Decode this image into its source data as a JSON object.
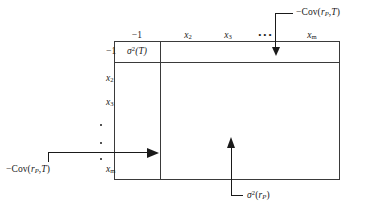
{
  "figure": {
    "colors": {
      "ink": "#1a1a1a",
      "rule": "#3a3a3a",
      "background": "#ffffff"
    }
  },
  "matrix": {
    "column_headers": [
      {
        "text": "−1"
      },
      {
        "text": "x",
        "sub": "2"
      },
      {
        "text": "x",
        "sub": "3"
      },
      {
        "text": "• • •"
      },
      {
        "text": "x",
        "sub": "m"
      }
    ],
    "row_headers": [
      {
        "text": "−1"
      },
      {
        "text": "x",
        "sub": "2"
      },
      {
        "text": "x",
        "sub": "3"
      },
      {
        "text": "•"
      },
      {
        "text": "•"
      },
      {
        "text": "•"
      },
      {
        "text": "x",
        "sub": "m"
      }
    ],
    "cells": [
      {
        "base": "σ",
        "sup": "2",
        "arg": "(T)"
      }
    ]
  },
  "annotations": {
    "top_right": {
      "minus": "−",
      "name": "Cov(",
      "var": "r",
      "sub": "P",
      "comma": ",",
      "second": "T",
      "close": ")"
    },
    "bottom_left": {
      "minus": "−",
      "name": "Cov(",
      "var": "r",
      "sub": "P",
      "comma": ",",
      "second": "T",
      "close": ")"
    },
    "bottom_center": {
      "base": "σ",
      "sup": "2",
      "open": "(",
      "var": "r",
      "sub": "P",
      "close": ")"
    },
    "row_label_bottom_left": {
      "text": "x",
      "sub": "m"
    }
  }
}
